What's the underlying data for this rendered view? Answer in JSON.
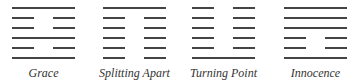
{
  "hexagrams": [
    {
      "name": "Grace",
      "lines_top_to_bottom": [
        "solid",
        "broken",
        "broken",
        "solid",
        "broken",
        "solid"
      ]
    },
    {
      "name": "Splitting Apart",
      "lines_top_to_bottom": [
        "solid",
        "broken",
        "broken",
        "broken",
        "broken",
        "broken"
      ]
    },
    {
      "name": "Turning Point",
      "lines_top_to_bottom": [
        "broken",
        "broken",
        "broken",
        "broken",
        "broken",
        "solid"
      ]
    },
    {
      "name": "Innocence",
      "lines_top_to_bottom": [
        "solid",
        "solid",
        "solid",
        "broken",
        "broken",
        "solid"
      ]
    }
  ],
  "colors": {
    "line": "#444444",
    "label": "#333333"
  }
}
